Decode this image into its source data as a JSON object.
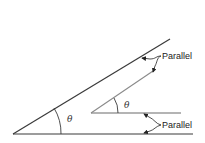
{
  "diagram": {
    "type": "geometry-angles",
    "colors": {
      "line_dark": "#3a3a3a",
      "line_light": "#8a8a8a",
      "text": "#222222"
    },
    "large_angle": {
      "symbol": "θ"
    },
    "small_angle": {
      "symbol": "θ"
    },
    "annotations": {
      "top": "Parallel",
      "bottom": "Parallel"
    }
  }
}
